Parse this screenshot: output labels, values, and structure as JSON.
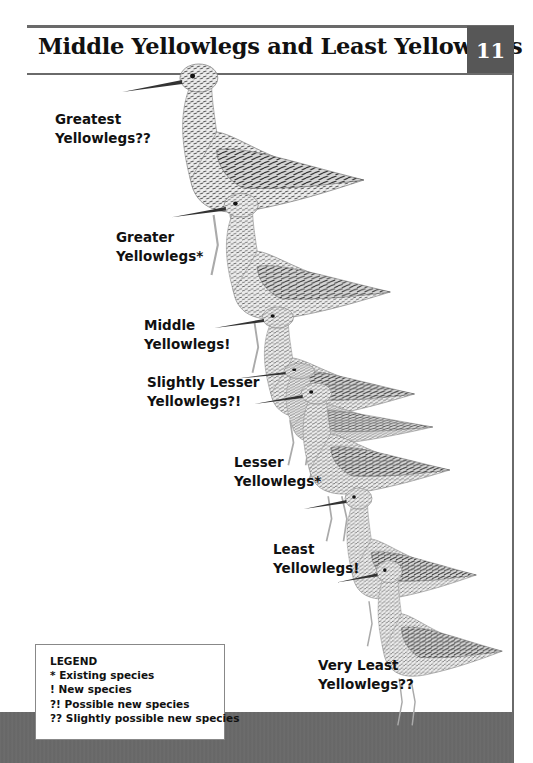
{
  "page": {
    "title": "Middle Yellowlegs and Least Yellowlegs",
    "page_number": "11"
  },
  "birds": [
    {
      "label_line1": "Greatest",
      "label_line2": "Yellowlegs??"
    },
    {
      "label_line1": "Greater",
      "label_line2": "Yellowlegs*"
    },
    {
      "label_line1": "Middle",
      "label_line2": "Yellowlegs!"
    },
    {
      "label_line1": "Slightly Lesser",
      "label_line2": "Yellowlegs?!"
    },
    {
      "label_line1": "Lesser",
      "label_line2": "Yellowlegs*"
    },
    {
      "label_line1": "Least",
      "label_line2": "Yellowlegs!"
    },
    {
      "label_line1": "Very Least",
      "label_line2": "Yellowlegs??"
    }
  ],
  "legend": {
    "title": "LEGEND",
    "items": [
      "* Existing species",
      "! New species",
      "?! Possible new species",
      "?? Slightly possible new species"
    ]
  },
  "colors": {
    "frame_gray": "#6a6a6a",
    "page_number_box": "#575757",
    "bottom_band": "#6b6b6b"
  }
}
